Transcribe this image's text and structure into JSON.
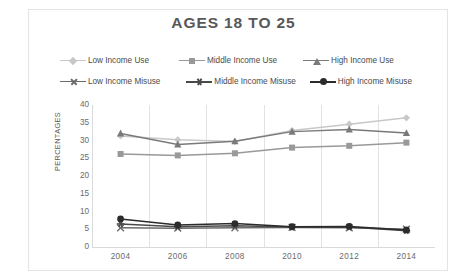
{
  "chart_data": {
    "type": "line",
    "title": "AGES 18 TO 25",
    "xlabel": "",
    "ylabel": "PERCENTAGES",
    "categories": [
      "2004",
      "2006",
      "2008",
      "2010",
      "2012",
      "2014"
    ],
    "x": [
      2004,
      2006,
      2008,
      2010,
      2012,
      2014
    ],
    "ylim": [
      0,
      40
    ],
    "yticks": [
      0,
      5,
      10,
      15,
      20,
      25,
      30,
      35,
      40
    ],
    "grid": "vertical",
    "legend_position": "top",
    "series": [
      {
        "name": "Low Income Use",
        "values": [
          31.3,
          30.2,
          29.7,
          32.8,
          34.6,
          36.4
        ],
        "color": "#c8c8c8",
        "marker": "diamond"
      },
      {
        "name": "Middle Income Use",
        "values": [
          26.2,
          25.8,
          26.4,
          28.0,
          28.5,
          29.4
        ],
        "color": "#999999",
        "marker": "square"
      },
      {
        "name": "High Income Use",
        "values": [
          32.0,
          28.9,
          29.8,
          32.5,
          33.1,
          32.1
        ],
        "color": "#7a7a7a",
        "marker": "triangle"
      },
      {
        "name": "Low Income Misuse",
        "values": [
          5.4,
          5.3,
          5.4,
          5.5,
          5.4,
          5.0
        ],
        "color": "#6b6b6b",
        "marker": "x"
      },
      {
        "name": "Middle Income Misuse",
        "values": [
          6.5,
          5.7,
          6.0,
          5.6,
          5.6,
          4.6
        ],
        "color": "#4a4a4a",
        "marker": "star"
      },
      {
        "name": "High Income Misuse",
        "values": [
          7.9,
          6.2,
          6.6,
          5.7,
          5.8,
          4.8
        ],
        "color": "#2b2b2b",
        "marker": "circle"
      }
    ]
  },
  "legend": {
    "row1": [
      "Low Income Use",
      "Middle Income Use",
      "High Income Use"
    ],
    "row2": [
      "Low Income Misuse",
      "Middle Income Misuse",
      "High Income Misuse"
    ]
  }
}
